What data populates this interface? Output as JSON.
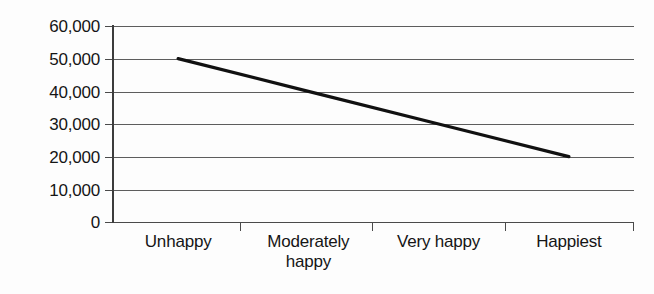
{
  "chart_data": {
    "type": "line",
    "title": "",
    "subtitle": "",
    "xlabel": "",
    "ylabel": "",
    "categories": [
      "Unhappy",
      "Moderately happy",
      "Very happy",
      "Happiest"
    ],
    "values": [
      50000,
      40000,
      30000,
      20000
    ],
    "series": [
      {
        "name": "",
        "values": [
          50000,
          40000,
          30000,
          20000
        ]
      }
    ],
    "ylim": [
      0,
      60000
    ],
    "yticks": [
      0,
      10000,
      20000,
      30000,
      40000,
      50000,
      60000
    ],
    "ytick_labels": [
      "0",
      "10,000",
      "20,000",
      "30,000",
      "40,000",
      "50,000",
      "60,000"
    ],
    "grid": true,
    "grid_axis": "y",
    "legend": false,
    "legend_position": "none",
    "annotations": [],
    "line_color": "#111111",
    "grid_color": "#5d5d5d",
    "axis_color": "#3c3c3c",
    "background_color": "#fdfdfd"
  },
  "axis": {
    "y_labels": [
      {
        "text": "60,000",
        "value": 60000
      },
      {
        "text": "50,000",
        "value": 50000
      },
      {
        "text": "40,000",
        "value": 40000
      },
      {
        "text": "30,000",
        "value": 30000
      },
      {
        "text": "20,000",
        "value": 20000
      },
      {
        "text": "10,000",
        "value": 10000
      },
      {
        "text": "0",
        "value": 0
      }
    ],
    "x_labels": [
      {
        "line1": "Unhappy",
        "line2": ""
      },
      {
        "line1": "Moderately",
        "line2": "happy"
      },
      {
        "line1": "Very happy",
        "line2": ""
      },
      {
        "line1": "Happiest",
        "line2": ""
      }
    ]
  }
}
